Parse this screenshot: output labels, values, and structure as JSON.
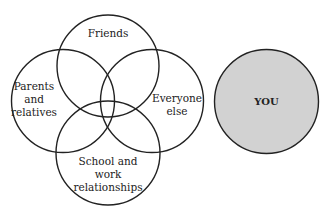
{
  "diagram": {
    "type": "venn",
    "circles": [
      {
        "id": "friends",
        "label_lines": [
          "Friends"
        ]
      },
      {
        "id": "parents",
        "label_lines": [
          "Parents",
          "and",
          "relatives"
        ]
      },
      {
        "id": "everyone",
        "label_lines": [
          "Everyone",
          "else"
        ]
      },
      {
        "id": "school",
        "label_lines": [
          "School and",
          "work",
          "relationships"
        ]
      }
    ],
    "separate_circle": {
      "id": "you",
      "label": "YOU",
      "fill": "#d2d2d2"
    },
    "stroke_color": "#222222"
  }
}
